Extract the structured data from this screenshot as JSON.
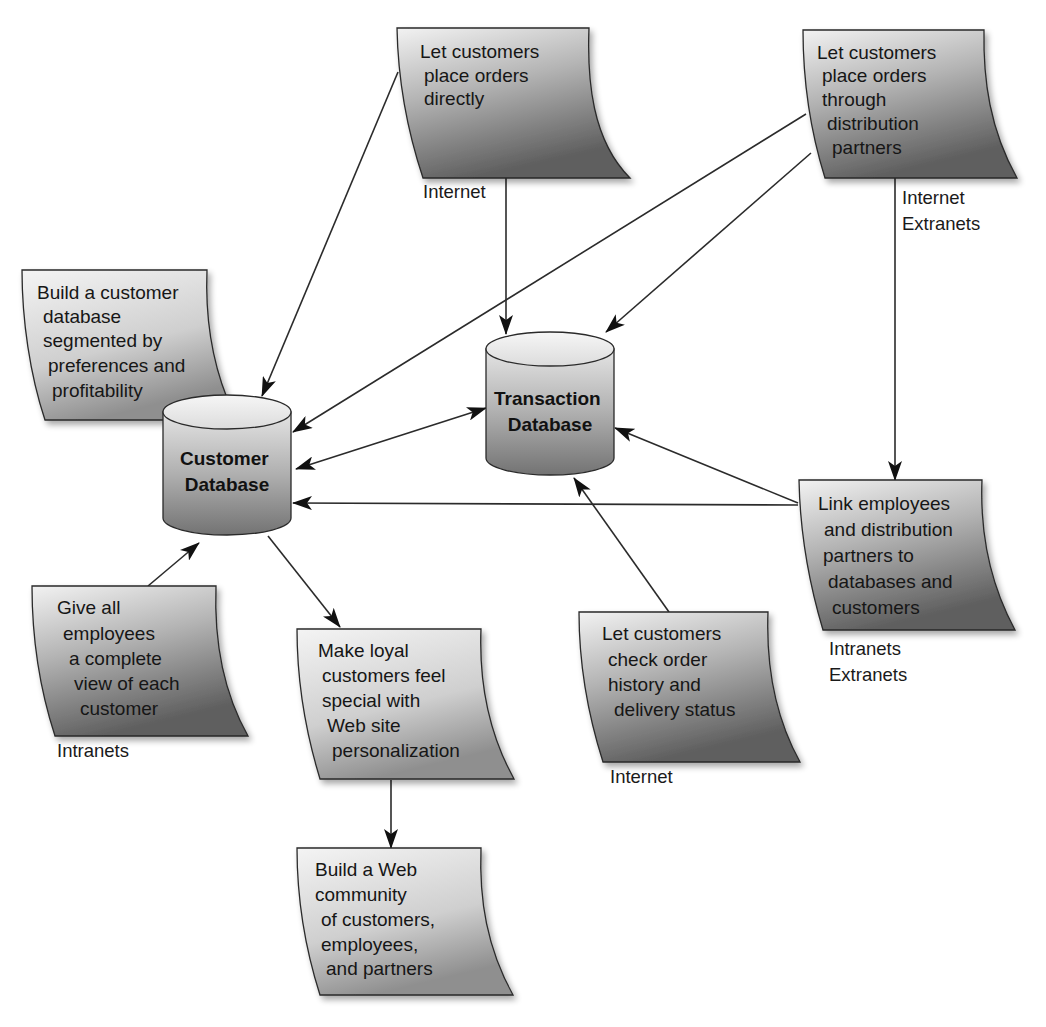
{
  "diagram": {
    "type": "customer-relationship-network",
    "databases": [
      {
        "id": "customer_db",
        "line1": "Customer",
        "line2": "Database"
      },
      {
        "id": "transaction_db",
        "line1": "Transaction",
        "line2": "Database"
      }
    ],
    "notes": {
      "place_direct": {
        "lines": [
          "Let customers",
          "place orders",
          "directly"
        ],
        "network": [
          "Internet"
        ]
      },
      "place_partners": {
        "lines": [
          "Let customers",
          "place orders",
          "through",
          "distribution",
          "partners"
        ],
        "network": [
          "Internet",
          "Extranets"
        ]
      },
      "build_db": {
        "lines": [
          "Build a customer",
          "database",
          "segmented by",
          "preferences and",
          "profitability"
        ],
        "network": []
      },
      "link_employees": {
        "lines": [
          "Link employees",
          "and distribution",
          "partners to",
          "databases and",
          "customers"
        ],
        "network": [
          "Intranets",
          "Extranets"
        ]
      },
      "give_employees": {
        "lines": [
          "Give all",
          "employees",
          "a complete",
          "view of each",
          "customer"
        ],
        "network": [
          "Intranets"
        ]
      },
      "loyal_customers": {
        "lines": [
          "Make loyal",
          "customers feel",
          "special with",
          "Web site",
          "personalization"
        ],
        "network": []
      },
      "order_history": {
        "lines": [
          "Let customers",
          "check order",
          "history and",
          "delivery status"
        ],
        "network": [
          "Internet"
        ]
      },
      "web_community": {
        "lines": [
          "Build a Web",
          "community",
          "of customers,",
          "employees,",
          "and partners"
        ],
        "network": []
      }
    },
    "edges": [
      {
        "from": "place_direct",
        "to": "customer_db"
      },
      {
        "from": "place_direct",
        "to": "transaction_db"
      },
      {
        "from": "place_partners",
        "to": "customer_db"
      },
      {
        "from": "place_partners",
        "to": "transaction_db"
      },
      {
        "from": "place_partners",
        "to": "link_employees"
      },
      {
        "from": "customer_db",
        "to": "transaction_db",
        "bidirectional": true
      },
      {
        "from": "link_employees",
        "to": "transaction_db"
      },
      {
        "from": "link_employees",
        "to": "customer_db"
      },
      {
        "from": "order_history",
        "to": "transaction_db"
      },
      {
        "from": "give_employees",
        "to": "customer_db"
      },
      {
        "from": "customer_db",
        "to": "loyal_customers"
      },
      {
        "from": "loyal_customers",
        "to": "web_community"
      }
    ],
    "colors": {
      "note_light": "#ececec",
      "note_dark": "#6e6e6e",
      "db_light": "#e6e6e6",
      "db_dark": "#7a7a7a",
      "line": "#2b2b2b",
      "background": "#ffffff"
    }
  }
}
